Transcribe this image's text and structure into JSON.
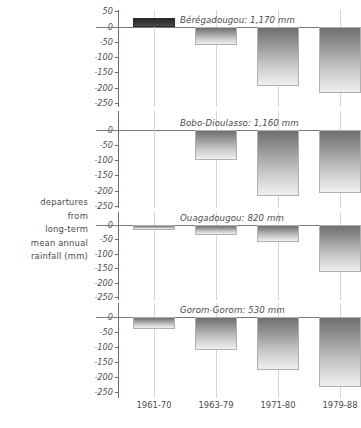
{
  "axis_title_lines": [
    "departures",
    "from",
    "long-term",
    "mean annual",
    "rainfall (mm)"
  ],
  "chart_data": {
    "type": "bar",
    "title": "",
    "xlabel": "",
    "ylabel": "departures from long-term mean annual rainfall (mm)",
    "categories": [
      "1961-70",
      "1963-79",
      "1971-80",
      "1979-88"
    ],
    "ylim": [
      -250,
      50
    ],
    "yticks": [
      50,
      0,
      -50,
      -100,
      -150,
      -200,
      -250
    ],
    "ytick_labels": [
      "50",
      "0",
      "-50",
      "-100",
      "-150",
      "-200",
      "-250"
    ],
    "grid": "vertical-only",
    "legend": "none",
    "panels": [
      {
        "name": "Beregadougou",
        "label": "Bérégadougou: 1,170 mm",
        "mean_annual_rainfall_mm": 1170,
        "values": [
          30,
          -60,
          -192,
          -218
        ]
      },
      {
        "name": "Bobo-Dioulasso",
        "label": "Bobo-Dioulasso: 1,160 mm",
        "mean_annual_rainfall_mm": 1160,
        "values": [
          0,
          -98,
          -218,
          -205
        ]
      },
      {
        "name": "Ouagadougou",
        "label": "Ouagadougou: 820 mm",
        "mean_annual_rainfall_mm": 820,
        "values": [
          -18,
          -33,
          -60,
          -163
        ]
      },
      {
        "name": "Gorom-Gorom",
        "label": "Gorom-Gorom: 530 mm",
        "mean_annual_rainfall_mm": 530,
        "values": [
          -40,
          -110,
          -178,
          -232
        ]
      }
    ]
  },
  "colors": {
    "bar_positive": "#2b2b2b",
    "bar_negative_top": "#6f6f6f",
    "bar_negative_bottom": "#efefef",
    "axis": "#6d6d6d",
    "gridline": "#d9d6cf",
    "text": "#4a4a4a",
    "background": "#ffffff"
  }
}
